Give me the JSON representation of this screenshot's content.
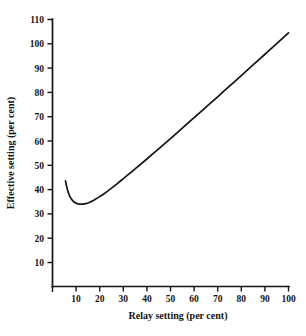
{
  "chart_data": {
    "type": "line",
    "title": "",
    "xlabel": "Relay setting (per cent)",
    "ylabel": "Effective setting (per cent)",
    "xlim": [
      0,
      103
    ],
    "ylim": [
      0,
      113
    ],
    "grid": false,
    "legend": null,
    "x_ticks": [
      10,
      20,
      30,
      40,
      50,
      60,
      70,
      80,
      90,
      100
    ],
    "y_ticks": [
      10,
      20,
      30,
      40,
      50,
      60,
      70,
      80,
      90,
      100,
      110
    ],
    "x_tick_labels": [
      "10",
      "20",
      "30",
      "40",
      "50",
      "60",
      "70",
      "80",
      "90",
      "100"
    ],
    "y_tick_labels": [
      "10",
      "20",
      "30",
      "40",
      "50",
      "60",
      "70",
      "80",
      "90",
      "100",
      "110"
    ],
    "series": [
      {
        "name": "Effective setting vs relay setting",
        "color": "#131313",
        "x": [
          5.5,
          6,
          6.5,
          7,
          7.5,
          8,
          9,
          10,
          11,
          12,
          13,
          14,
          15,
          16,
          17,
          18,
          20,
          22,
          25,
          28,
          30,
          35,
          40,
          45,
          50,
          55,
          60,
          65,
          70,
          75,
          80,
          85,
          90,
          95,
          100
        ],
        "y": [
          43.6,
          41.2,
          39.4,
          38.0,
          36.9,
          36.1,
          35.0,
          34.4,
          34.1,
          34.0,
          34.0,
          34.2,
          34.5,
          34.9,
          35.4,
          35.9,
          37.1,
          38.4,
          40.6,
          42.9,
          44.5,
          48.5,
          52.6,
          56.8,
          61.0,
          65.3,
          69.6,
          73.9,
          78.2,
          82.6,
          86.9,
          91.3,
          95.7,
          100.1,
          104.5
        ]
      }
    ],
    "annotations": {
      "minimum_value": 34.0,
      "minimum_at_x": 13
    }
  }
}
